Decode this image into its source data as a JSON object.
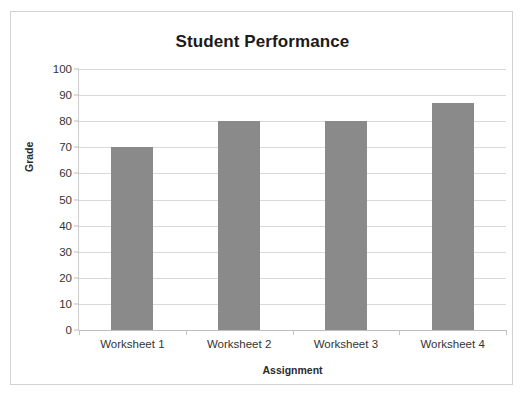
{
  "chart_data": {
    "type": "bar",
    "title": "Student Performance",
    "xlabel": "Assignment",
    "ylabel": "Grade",
    "categories": [
      "Worksheet 1",
      "Worksheet 2",
      "Worksheet 3",
      "Worksheet 4"
    ],
    "values": [
      70,
      80,
      80,
      87
    ],
    "ylim": [
      0,
      100
    ],
    "ytick_step": 10,
    "yticks": [
      100,
      90,
      80,
      70,
      60,
      50,
      40,
      30,
      20,
      10,
      0
    ],
    "ytick_labels": [
      "100",
      "90",
      "80",
      "70",
      "60",
      "50",
      "40",
      "30",
      "20",
      "10",
      "0"
    ],
    "grid": "horizontal",
    "legend": null,
    "legend_position": "none",
    "series": [
      {
        "name": "Grade",
        "values": [
          70,
          80,
          80,
          87
        ],
        "color": "#8a8a8a"
      }
    ],
    "colors": {
      "bar": "#8a8a8a",
      "gridline": "#d9d9d9",
      "axis": "#bdbdbd",
      "title_text": "#1b1b1b",
      "tick_text": "#333333",
      "axis_title_text": "#2b2b2b",
      "frame_border": "#d2d2d2",
      "background": "#ffffff"
    }
  }
}
